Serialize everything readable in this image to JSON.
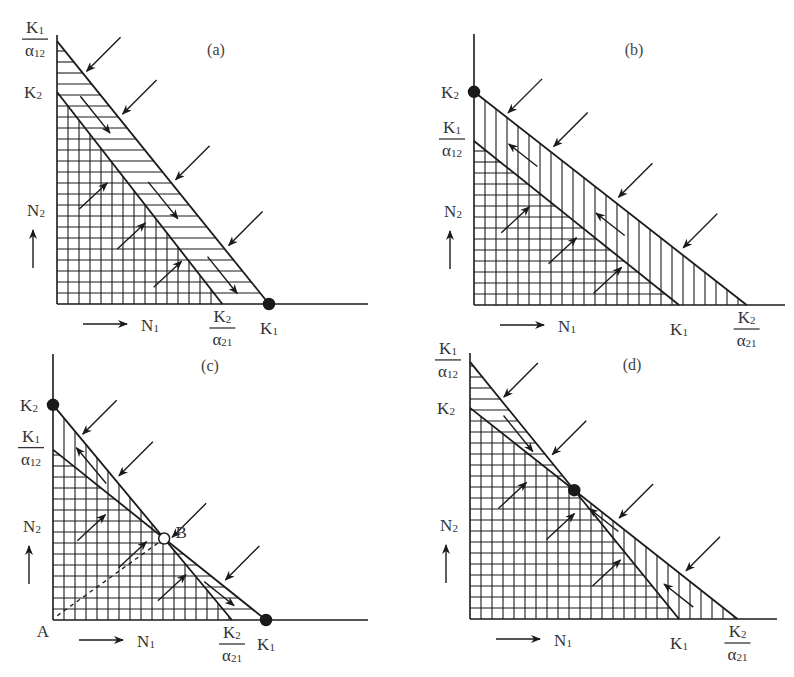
{
  "figure": {
    "colors": {
      "ink": "#1a1a1a",
      "text": "#333333",
      "background": "#ffffff"
    }
  },
  "panels": [
    {
      "id": "a",
      "title": "(a)",
      "y_axis_label": "N2",
      "x_axis_label": "N1",
      "values": {
        "K1": 1.0,
        "K2": 1.0,
        "K1_over_a12": 1.24,
        "K2_over_a21": 0.78
      },
      "y_ticks": [
        {
          "value_key": "K1_over_a12",
          "num": "K1",
          "den": "α12"
        },
        {
          "value_key": "K2",
          "text": "K2"
        }
      ],
      "x_ticks": [
        {
          "value_key": "K2_over_a21",
          "num": "K2",
          "den": "α21"
        },
        {
          "value_key": "K1",
          "text": "K1"
        }
      ],
      "hatch": {
        "upper_band": "horizontal",
        "lower_triangle": "grid"
      },
      "equilibria": [
        {
          "at": "K1_on_x",
          "type": "stable",
          "label": ""
        }
      ],
      "outcome": "Species 1 wins"
    },
    {
      "id": "b",
      "title": "(b)",
      "y_axis_label": "N2",
      "x_axis_label": "N1",
      "values": {
        "K1": 1.0,
        "K2": 1.04,
        "K1_over_a12": 0.8,
        "K2_over_a21": 1.33
      },
      "y_ticks": [
        {
          "value_key": "K2",
          "text": "K2"
        },
        {
          "value_key": "K1_over_a12",
          "num": "K1",
          "den": "α12"
        }
      ],
      "x_ticks": [
        {
          "value_key": "K1",
          "text": "K1"
        },
        {
          "value_key": "K2_over_a21",
          "num": "K2",
          "den": "α21"
        }
      ],
      "hatch": {
        "upper_band": "vertical",
        "lower_triangle": "grid"
      },
      "equilibria": [
        {
          "at": "K2_on_y",
          "type": "stable",
          "label": ""
        }
      ],
      "outcome": "Species 2 wins"
    },
    {
      "id": "c",
      "title": "(c)",
      "y_axis_label": "N2",
      "x_axis_label": "N1",
      "origin_label": "A",
      "values": {
        "K1": 1.0,
        "K2": 1.01,
        "K1_over_a12": 0.8,
        "K2_over_a21": 0.84
      },
      "y_ticks": [
        {
          "value_key": "K2",
          "text": "K2"
        },
        {
          "value_key": "K1_over_a12",
          "num": "K1",
          "den": "α12"
        }
      ],
      "x_ticks": [
        {
          "value_key": "K2_over_a21",
          "num": "K2",
          "den": "α21"
        },
        {
          "value_key": "K1",
          "text": "K1"
        }
      ],
      "hatch": {
        "upper_band": "mixed",
        "lower_triangle": "grid"
      },
      "equilibria": [
        {
          "at": "K2_on_y",
          "type": "stable",
          "label": ""
        },
        {
          "at": "K1_on_x",
          "type": "stable",
          "label": ""
        },
        {
          "at": "intersection",
          "type": "unstable",
          "label": "B"
        }
      ],
      "separatrix": {
        "from": "A",
        "to": "B",
        "style": "dashed"
      },
      "outcome": "Unstable equilibrium; outcome depends on initial state"
    },
    {
      "id": "d",
      "title": "(d)",
      "y_axis_label": "N2",
      "x_axis_label": "N1",
      "values": {
        "K1": 1.0,
        "K2": 1.01,
        "K1_over_a12": 1.23,
        "K2_over_a21": 1.28
      },
      "y_ticks": [
        {
          "value_key": "K1_over_a12",
          "num": "K1",
          "den": "α12"
        },
        {
          "value_key": "K2",
          "text": "K2"
        }
      ],
      "x_ticks": [
        {
          "value_key": "K1",
          "text": "K1"
        },
        {
          "value_key": "K2_over_a21",
          "num": "K2",
          "den": "α21"
        }
      ],
      "hatch": {
        "upper_band": "mixed",
        "lower_triangle": "grid"
      },
      "equilibria": [
        {
          "at": "intersection",
          "type": "stable",
          "label": ""
        }
      ],
      "outcome": "Stable coexistence"
    }
  ]
}
